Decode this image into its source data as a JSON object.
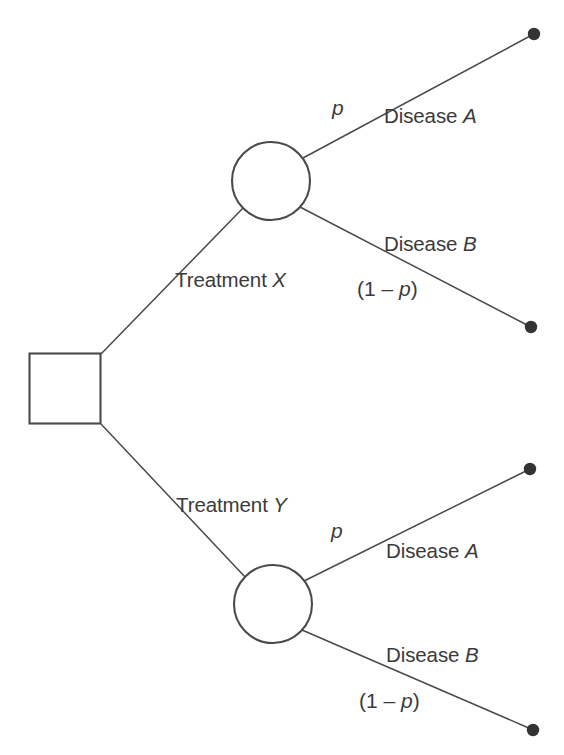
{
  "diagram": {
    "type": "decision-tree",
    "title": "",
    "stroke_color": "#4a4a4a",
    "text_color": "#3b3b3b",
    "background_color": "#ffffff",
    "nodes": {
      "decision": {
        "shape": "square",
        "x": 29,
        "y": 353,
        "size": 72
      },
      "chance_upper": {
        "shape": "circle",
        "cx": 271,
        "cy": 181,
        "r": 39
      },
      "chance_lower": {
        "shape": "circle",
        "cx": 273,
        "cy": 604,
        "r": 39
      },
      "terminals": [
        {
          "cx": 534,
          "cy": 34
        },
        {
          "cx": 531,
          "cy": 327
        },
        {
          "cx": 530,
          "cy": 469
        },
        {
          "cx": 533,
          "cy": 730
        }
      ]
    },
    "labels": {
      "treatment_x": "Treatment ",
      "treatment_x_var": "X",
      "treatment_y": "Treatment ",
      "treatment_y_var": "Y",
      "upper_p": "p",
      "upper_disease_a": "Disease ",
      "upper_disease_a_var": "A",
      "upper_disease_b": "Disease ",
      "upper_disease_b_var": "B",
      "upper_one_minus_p_open": "(1 – ",
      "upper_one_minus_p_var": "p",
      "upper_one_minus_p_close": ")",
      "lower_p": "p",
      "lower_disease_a": "Disease ",
      "lower_disease_a_var": "A",
      "lower_disease_b": "Disease ",
      "lower_disease_b_var": "B",
      "lower_one_minus_p_open": "(1 – ",
      "lower_one_minus_p_var": "p",
      "lower_one_minus_p_close": ")"
    }
  }
}
